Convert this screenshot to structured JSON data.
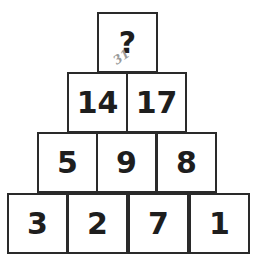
{
  "puzzle": {
    "rows": [
      [
        "?"
      ],
      [
        "14",
        "17"
      ],
      [
        "5",
        "9",
        "8"
      ],
      [
        "3",
        "2",
        "7",
        "1"
      ]
    ],
    "handwritten_note": "31"
  }
}
